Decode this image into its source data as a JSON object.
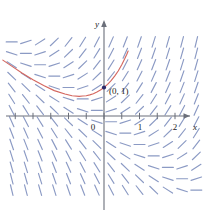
{
  "figure": {
    "title": "",
    "background_color": "#ffffff"
  },
  "chart_data": {
    "type": "scatter",
    "subtype": "direction-field",
    "title": "",
    "xlabel": "x",
    "ylabel": "y",
    "xlim": [
      -2.9,
      2.85
    ],
    "ylim": [
      -2.95,
      3.05
    ],
    "grid": false,
    "legend": null,
    "equation": "dy/dx = x + y",
    "axis_color": "#6b6f7a",
    "segment_color": "#8b9ac4",
    "curve_color": "#d4675f",
    "point_color": "#2b2b6b",
    "xticks": [
      {
        "value": 0,
        "label": "0",
        "major": true
      },
      {
        "value": 0.5,
        "label": "",
        "major": false
      },
      {
        "value": 1,
        "label": "1",
        "major": true
      },
      {
        "value": 1.5,
        "label": "",
        "major": false
      },
      {
        "value": 2,
        "label": "2",
        "major": true
      },
      {
        "value": 2.5,
        "label": "",
        "major": false
      },
      {
        "value": -0.5,
        "label": "",
        "major": false
      },
      {
        "value": -1,
        "label": "",
        "major": false
      },
      {
        "value": -1.5,
        "label": "",
        "major": false
      },
      {
        "value": -2,
        "label": "",
        "major": false
      },
      {
        "value": -2.5,
        "label": "",
        "major": false
      }
    ],
    "yticks": [],
    "annotations": [
      {
        "name": "initial-point",
        "x": 0,
        "y": 1,
        "label": "(0, 1)",
        "marker": "dot"
      }
    ],
    "field": {
      "x_values": [
        -2.6,
        -2.2,
        -1.8,
        -1.4,
        -1.0,
        -0.6,
        -0.2,
        0.2,
        0.6,
        1.0,
        1.4,
        1.8,
        2.2,
        2.6
      ],
      "y_values": [
        2.6,
        2.2,
        1.8,
        1.4,
        1.0,
        0.6,
        0.2,
        -0.2,
        -0.6,
        -1.0,
        -1.4,
        -1.8,
        -2.2,
        -2.6
      ],
      "slope_rule": "x + y",
      "segment_length": 11
    },
    "solution_curve": {
      "name": "solution through (0,1)",
      "equation": "y = 2e^x - x - 1",
      "x_start": -2.85,
      "x_end": 0.68,
      "points": [
        [
          -2.85,
          1.96
        ],
        [
          -2.6,
          1.75
        ],
        [
          -2.3,
          1.5
        ],
        [
          -2.0,
          1.27
        ],
        [
          -1.7,
          1.07
        ],
        [
          -1.4,
          0.89
        ],
        [
          -1.1,
          0.77
        ],
        [
          -0.9,
          0.71
        ],
        [
          -0.7,
          0.69
        ],
        [
          -0.6,
          0.7
        ],
        [
          -0.5,
          0.71
        ],
        [
          -0.4,
          0.74
        ],
        [
          -0.3,
          0.78
        ],
        [
          -0.2,
          0.84
        ],
        [
          -0.1,
          0.91
        ],
        [
          0.0,
          1.0
        ],
        [
          0.1,
          1.11
        ],
        [
          0.2,
          1.24
        ],
        [
          0.3,
          1.4
        ],
        [
          0.4,
          1.58
        ],
        [
          0.5,
          1.8
        ],
        [
          0.58,
          2.0
        ],
        [
          0.64,
          2.16
        ],
        [
          0.68,
          2.28
        ]
      ]
    }
  },
  "labels": {
    "x_axis": "x",
    "y_axis": "y",
    "tick_0": "0",
    "tick_1": "1",
    "tick_2": "2",
    "initial_point": "(0, 1)"
  }
}
